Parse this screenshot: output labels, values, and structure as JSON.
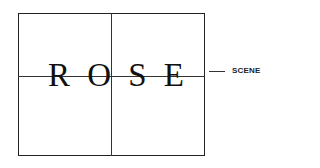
{
  "diagram": {
    "title_letters": [
      "R",
      "O",
      "S",
      "E"
    ],
    "label": "SCENE",
    "colors": {
      "line": "#333333",
      "text": "#111111",
      "background": "#ffffff"
    }
  }
}
